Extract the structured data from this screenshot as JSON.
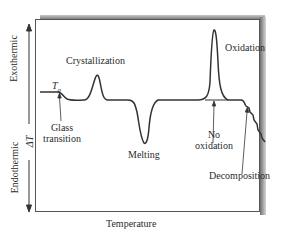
{
  "diagram": {
    "type": "DSC thermogram",
    "x_axis_label": "Temperature",
    "y_axis": {
      "upper_label": "Exothermic",
      "lower_label": "Endothermic",
      "center_label": "ΔT"
    },
    "annotations": {
      "tg_symbol": "T",
      "tg_subscript": "g",
      "glass_transition_line1": "Glass",
      "glass_transition_line2": "transition",
      "crystallization": "Crystallization",
      "melting": "Melting",
      "oxidation": "Oxidation",
      "no_oxidation_line1": "No",
      "no_oxidation_line2": "oxidation",
      "decomposition": "Decomposition"
    },
    "colors": {
      "curve": "#333333",
      "frame": "#555555",
      "shadow": "#6e6e6e"
    }
  }
}
